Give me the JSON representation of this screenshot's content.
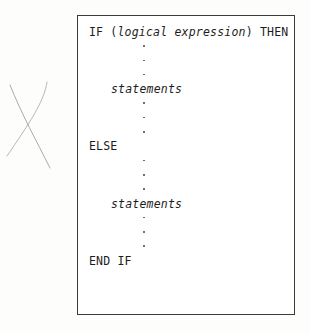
{
  "figure": {
    "name": "if-then-else-block",
    "margin_mark": "pencil-x-mark",
    "border_color": "#3a3a3a",
    "text_color": "#1d1d1d",
    "background_color": "#ffffff"
  },
  "code": {
    "line_if_keyword": "IF (",
    "line_if_argument": "logical expression",
    "line_if_tail": ") THEN",
    "then_statements": "statements",
    "line_else": "ELSE",
    "else_statements": "statements",
    "line_end": "END IF",
    "ellipsis_dot": "·"
  }
}
